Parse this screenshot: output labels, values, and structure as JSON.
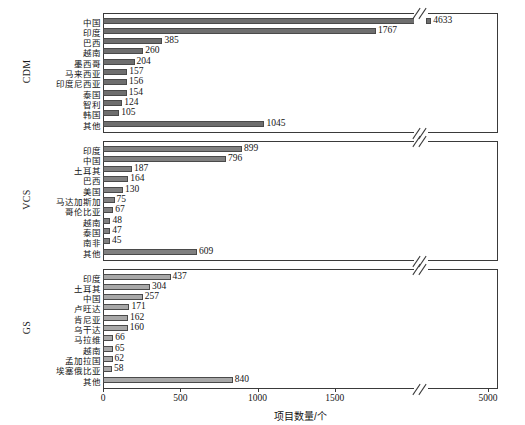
{
  "chart_data": {
    "type": "bar",
    "orientation": "horizontal",
    "title": "",
    "xlabel": "项目数量/个",
    "ylabel": "",
    "grid": false,
    "legend": null,
    "xticks": [
      0,
      500,
      1000,
      1500,
      5000
    ],
    "xtick_labels": [
      "0",
      "500",
      "1000",
      "1500",
      "5000"
    ],
    "axis_break": {
      "present": true,
      "between": [
        1800,
        4400
      ],
      "note": "broken x-axis"
    },
    "panels": [
      {
        "name": "CDM",
        "label": "CDM",
        "bar_color": "#6e6e6e",
        "categories": [
          "中国",
          "印度",
          "巴西",
          "越南",
          "墨西哥",
          "马来西亚",
          "印度尼西亚",
          "泰国",
          "智利",
          "韩国",
          "其他"
        ],
        "values": [
          4633,
          1767,
          385,
          260,
          204,
          157,
          156,
          154,
          124,
          105,
          1045
        ]
      },
      {
        "name": "VCS",
        "label": "VCS",
        "bar_color": "#808080",
        "categories": [
          "印度",
          "中国",
          "土耳其",
          "巴西",
          "美国",
          "马达加斯加",
          "哥伦比亚",
          "越南",
          "泰国",
          "南非",
          "其他"
        ],
        "values": [
          899,
          796,
          187,
          164,
          130,
          75,
          67,
          48,
          47,
          45,
          609
        ]
      },
      {
        "name": "GS",
        "label": "GS",
        "bar_color": "#a8a8a8",
        "categories": [
          "印度",
          "土耳其",
          "中国",
          "卢旺达",
          "肯尼亚",
          "乌干达",
          "马拉维",
          "越南",
          "孟加拉国",
          "埃塞俄比亚",
          "其他"
        ],
        "values": [
          437,
          304,
          257,
          171,
          162,
          160,
          66,
          65,
          62,
          58,
          840
        ]
      }
    ]
  },
  "colors": {
    "axis": "#3a3a3a",
    "text": "#141414",
    "background": "#ffffff",
    "bar_edge": "#4a4a4a"
  }
}
